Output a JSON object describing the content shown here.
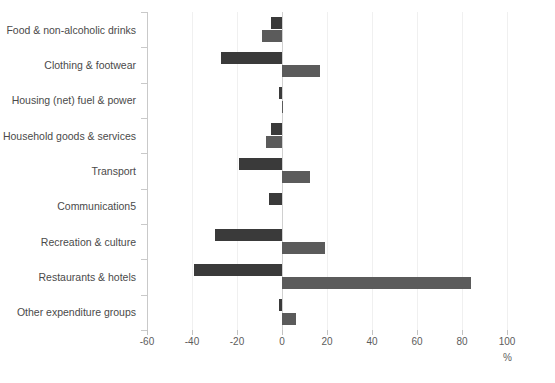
{
  "page": {
    "title_remnant": "",
    "background_color": "#ffffff"
  },
  "chart_data": {
    "type": "bar",
    "orientation": "horizontal",
    "title": "",
    "xlabel": "%",
    "ylabel": "",
    "xlim": [
      -60,
      100
    ],
    "xticks": [
      -60,
      -40,
      -20,
      0,
      20,
      40,
      60,
      80,
      100
    ],
    "xtick_labels": [
      "-60",
      "-40",
      "-20",
      "0",
      "20",
      "40",
      "60",
      "80",
      "100"
    ],
    "grid": false,
    "legend": "none",
    "categories": [
      "Food & non-alcoholic drinks",
      "Clothing & footwear",
      "Housing (net) fuel & power",
      "Household goods & services",
      "Transport",
      "Communication5",
      "Recreation & culture",
      "Restaurants & hotels",
      "Other expenditure groups"
    ],
    "series": [
      {
        "name": "Series A",
        "color": "#3a3a3a",
        "values": [
          -5,
          -27,
          -1.5,
          -5,
          -19,
          -6,
          -30,
          -39,
          -1.5
        ]
      },
      {
        "name": "Series B",
        "color": "#5b5b5b",
        "values": [
          -9,
          17,
          0.5,
          -7,
          12.5,
          0,
          19,
          84,
          6
        ]
      }
    ],
    "axis_color": "#c9c9c9",
    "tick_color": "#c2c2c2",
    "label_color": "#4a4a4a"
  }
}
